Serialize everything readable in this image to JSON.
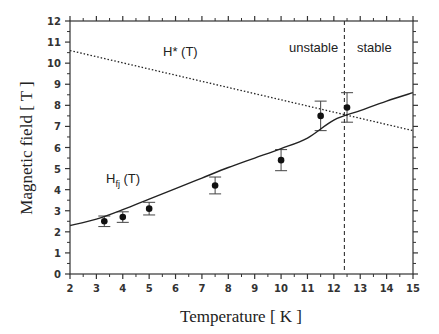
{
  "chart_data": {
    "type": "scatter",
    "title": "",
    "xlabel": "Temperature  [ K ]",
    "ylabel": "Magnetic field  [ T ]",
    "xlim": [
      2,
      15
    ],
    "ylim": [
      0,
      12
    ],
    "xticks": [
      2,
      3,
      4,
      5,
      6,
      7,
      8,
      9,
      10,
      11,
      12,
      13,
      14,
      15
    ],
    "yticks": [
      0,
      1,
      2,
      3,
      4,
      5,
      6,
      7,
      8,
      9,
      10,
      11,
      12
    ],
    "grid": false,
    "legend": null,
    "series": [
      {
        "name": "measured data",
        "type": "scatter",
        "x": [
          3.3,
          4.0,
          5.0,
          7.5,
          10.0,
          11.5,
          12.5
        ],
        "y": [
          2.5,
          2.7,
          3.1,
          4.2,
          5.4,
          7.5,
          7.9
        ],
        "err_low": [
          2.25,
          2.45,
          2.8,
          3.8,
          4.9,
          6.8,
          7.2
        ],
        "err_high": [
          2.75,
          2.95,
          3.4,
          4.6,
          5.9,
          8.2,
          8.6
        ]
      },
      {
        "name": "H_fj (T)",
        "type": "line",
        "style": "solid",
        "x": [
          2,
          3,
          4,
          5,
          6,
          7,
          8,
          9,
          10,
          11,
          12,
          13,
          14,
          15
        ],
        "y": [
          2.3,
          2.6,
          3.05,
          3.55,
          4.05,
          4.55,
          5.05,
          5.5,
          5.95,
          6.45,
          7.3,
          7.75,
          8.2,
          8.6
        ]
      },
      {
        "name": "H* (T)",
        "type": "line",
        "style": "dotted",
        "x": [
          2,
          15
        ],
        "y": [
          10.6,
          6.8
        ]
      }
    ],
    "vertical_lines": [
      {
        "x": 12.4,
        "style": "dashed"
      }
    ],
    "annotations": [
      {
        "text": "H* (T)",
        "x": 5.5,
        "y": 10.8
      },
      {
        "text": "H_fj (T)",
        "x": 3.4,
        "y": 4.3
      },
      {
        "text": "unstable",
        "x": 10.7,
        "y": 10.8
      },
      {
        "text": "stable",
        "x": 13.3,
        "y": 10.8
      }
    ]
  },
  "labels": {
    "hstar": "H* (T)",
    "hfj_main": "H",
    "hfj_sub": "fj",
    "hfj_tail": " (T)",
    "unstable": "unstable",
    "stable": "stable",
    "xlabel": "Temperature  [ K ]",
    "ylabel": "Magnetic field  [ T ]"
  }
}
